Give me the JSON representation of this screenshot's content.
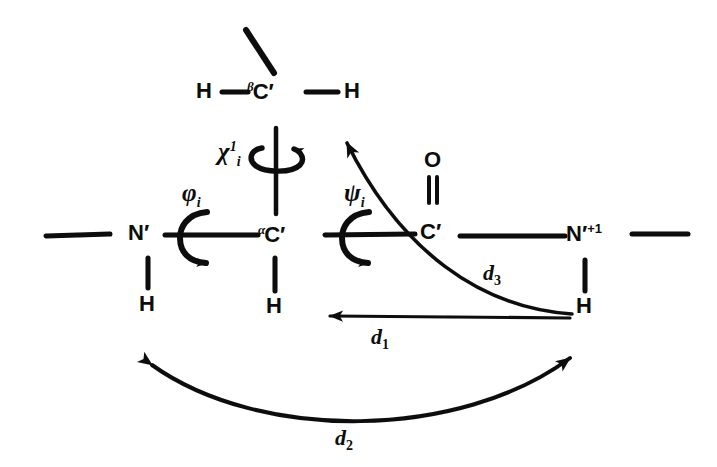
{
  "figure": {
    "kind": "hand-drawn-peptide-backbone-diagram",
    "background_color": "#ffffff",
    "ink_color": "#0d0d0d"
  },
  "atoms": {
    "beta_carbon": {
      "alpha_prefix": "β",
      "symbol": "C",
      "prime": "′"
    },
    "beta_h_left": {
      "symbol": "H"
    },
    "beta_h_right": {
      "symbol": "H"
    },
    "alpha_carbon": {
      "alpha_prefix": "α",
      "symbol": "C",
      "prime": "′"
    },
    "alpha_h": {
      "symbol": "H"
    },
    "nitrogen_i": {
      "symbol": "N",
      "prime": "′"
    },
    "nitrogen_i_h": {
      "symbol": "H"
    },
    "carbonyl_carbon": {
      "symbol": "C",
      "prime": "′"
    },
    "carbonyl_oxygen": {
      "symbol": "O"
    },
    "nitrogen_i_plus_1": {
      "symbol": "N",
      "prime": "′",
      "superscript": "+1"
    },
    "nitrogen_i_plus_1_h": {
      "symbol": "H"
    }
  },
  "torsion_angles": [
    {
      "id": "phi",
      "glyph": "φ",
      "subscript": "i",
      "name": "phi-i"
    },
    {
      "id": "psi",
      "glyph": "ψ",
      "subscript": "i",
      "name": "psi-i"
    },
    {
      "id": "chi",
      "glyph": "χ",
      "superscript": "1",
      "subscript": "i",
      "name": "chi-i-1"
    }
  ],
  "distances": [
    {
      "id": "d1",
      "glyph": "d",
      "subscript": "1",
      "arrow": "single-head-left"
    },
    {
      "id": "d2",
      "glyph": "d",
      "subscript": "2",
      "arrow": "double-head-arc"
    },
    {
      "id": "d3",
      "glyph": "d",
      "subscript": "3",
      "arrow": "single-head-up-left-curved"
    }
  ],
  "bonds": {
    "double_bond_label": "C=O double bond",
    "backbone_label": "peptide backbone chain"
  }
}
